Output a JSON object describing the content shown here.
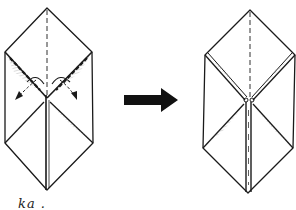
{
  "diagram": {
    "type": "origami-folding-step",
    "steps": [
      {
        "id": "before",
        "description": "Folded paper with two diagonal valley-fold arrows on upper flaps"
      },
      {
        "id": "after",
        "description": "Result after folding both upper flaps down to center"
      }
    ],
    "arrow": {
      "label": "",
      "direction": "right",
      "color": "#111111"
    },
    "caption_fragment": "ka .",
    "stroke_color": "#1a1a1a",
    "background": "#ffffff"
  }
}
